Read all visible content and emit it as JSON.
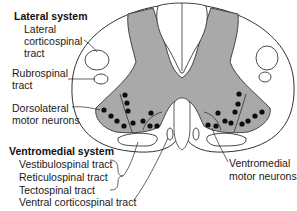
{
  "diagram": {
    "colors": {
      "grey_matter": "#a9a9a9",
      "outline": "#333333",
      "motor_neuron": "#0d0d0d",
      "white_matter": "#ffffff"
    },
    "lateral_system": {
      "heading": "Lateral system",
      "tracts": [
        {
          "line1": "Lateral",
          "line2": "corticospinal",
          "line3": "tract"
        },
        {
          "line1": "Rubrospinal",
          "line2": "tract"
        }
      ]
    },
    "dorsolateral": {
      "line1": "Dorsolateral",
      "line2": "motor neurons"
    },
    "ventromedial_system": {
      "heading": "Ventromedial system",
      "tracts": [
        "Vestibulospinal tract",
        "Reticulospinal tract",
        "Tectospinal tract",
        "Ventral corticospinal tract"
      ]
    },
    "ventromedial_neurons": {
      "line1": "Ventromedial",
      "line2": "motor neurons"
    }
  }
}
